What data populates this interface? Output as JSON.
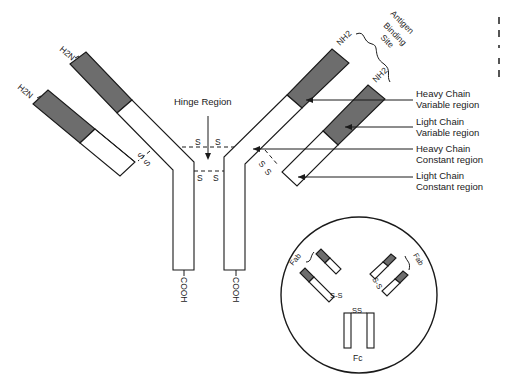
{
  "figure": {
    "labels": {
      "h2n_left_heavy": "H2N",
      "h2n_left_light": "H2N",
      "nh2_right_heavy": "NH2",
      "nh2_right_light": "NH2",
      "cooh_left": "COOH",
      "cooh_right": "COOH",
      "hinge_region": "Hinge Region",
      "antigen_binding_site": [
        "Antigen",
        "Binding",
        "Site"
      ],
      "disulfide": "S",
      "disulfide_pair": "S S"
    },
    "callouts": [
      {
        "line1": "Heavy Chain",
        "line2": "Variable region"
      },
      {
        "line1": "Light Chain",
        "line2": "Variable region"
      },
      {
        "line1": "Heavy Chain",
        "line2": "Constant region"
      },
      {
        "line1": "Light Chain",
        "line2": "Constant region"
      }
    ],
    "inset": {
      "fab_left": "Fab",
      "fab_right": "Fab",
      "fc": "Fc",
      "ss_left": "S-S",
      "ss_right": "S-S",
      "ss_fc": "SS"
    },
    "colors": {
      "variable_region": "#6d6d6d",
      "constant_region": "#ffffff",
      "line": "#1a1a1a"
    }
  }
}
